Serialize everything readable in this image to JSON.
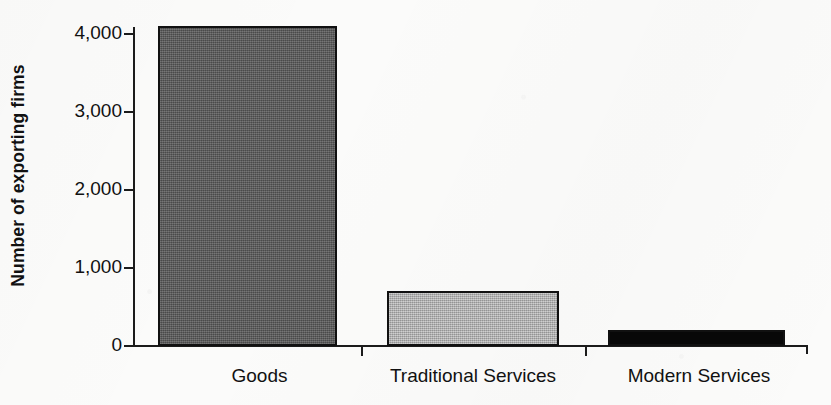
{
  "chart_data": {
    "type": "bar",
    "title": "",
    "subtitle": "",
    "xlabel": "",
    "ylabel": "Number of exporting firms",
    "categories": [
      "Goods",
      "Traditional Services",
      "Modern Services"
    ],
    "values": [
      4100,
      700,
      200
    ],
    "series": [
      {
        "name": "Number of exporting firms",
        "values": [
          4100,
          700,
          200
        ]
      }
    ],
    "ylim": [
      0,
      4300
    ],
    "yticks": [
      0,
      1000,
      2000,
      3000,
      4000
    ],
    "ytick_labels": [
      "0",
      "1,000",
      "2,000",
      "3,000",
      "4,000"
    ],
    "grid": false,
    "legend": false,
    "legend_position": "none",
    "bar_styles": [
      {
        "category": "Goods",
        "fill": "#595959",
        "pattern": "dark-gray-dither",
        "edge": "#111111"
      },
      {
        "category": "Traditional Services",
        "fill": "#b3b3b3",
        "pattern": "light-gray-dither",
        "edge": "#111111"
      },
      {
        "category": "Modern Services",
        "fill": "#080808",
        "pattern": "solid-black",
        "edge": "#111111"
      }
    ],
    "colors": {
      "background": "#fbfbfa",
      "axis": "#1b1b1b",
      "text": "#111111"
    }
  }
}
